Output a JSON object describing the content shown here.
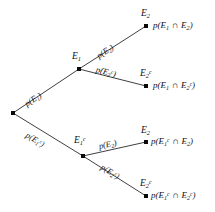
{
  "diagram": {
    "type": "probability-tree",
    "background_color": "#ffffff",
    "line_color": "#2a2a2a",
    "text_color": "#111111",
    "root": {
      "name": "root-node",
      "x": 13,
      "y": 113
    },
    "stage1_nodes": [
      {
        "id": "E1",
        "label_html": "E<span class=\"sub\">1</span>",
        "label_text": "E1",
        "x": 79,
        "y": 69,
        "branch_probability_html": "p(E<span class=\"sub\">1</span>)",
        "branch_probability_text": "p(E1)"
      },
      {
        "id": "E1c",
        "label_html": "E<span class=\"sub\">1</span><span class=\"sup\">c</span>",
        "label_text": "E1^c",
        "x": 83,
        "y": 156,
        "branch_probability_html": "p(E<span class=\"sub\">1</span><span class=\"sup\">c</span>)",
        "branch_probability_text": "p(E1^c)"
      }
    ],
    "leaves": [
      {
        "id": "leaf-E1-E2",
        "node_label_html": "E<span class=\"sub\">2</span>",
        "node_label_text": "E2",
        "x": 146,
        "y": 26,
        "branch_probability_html": "p(E<span class=\"sub\">2</span>)",
        "branch_probability_text": "p(E2)",
        "outcome_html": "p(E<span class=\"sub\">1</span> <span class=\"cap\">&#8745;</span> E<span class=\"sub\">2</span>)",
        "outcome_text": "p(E1 ∩ E2)"
      },
      {
        "id": "leaf-E1-E2c",
        "node_label_html": "E<span class=\"sub\">2</span><span class=\"sup\">c</span>",
        "node_label_text": "E2^c",
        "x": 146,
        "y": 86,
        "branch_probability_html": "p(E<span class=\"sub\">2</span><span class=\"sup\">c</span>)",
        "branch_probability_text": "p(E2^c)",
        "outcome_html": "p(E<span class=\"sub\">1</span> <span class=\"cap\">&#8745;</span> E<span class=\"sub\">2</span><span class=\"sup\">c</span>)",
        "outcome_text": "p(E1 ∩ E2^c)"
      },
      {
        "id": "leaf-E1c-E2",
        "node_label_html": "E<span class=\"sub\">2</span>",
        "node_label_text": "E2",
        "x": 146,
        "y": 142,
        "branch_probability_html": "p(E<span class=\"sub\">2</span>)",
        "branch_probability_text": "p(E2)",
        "outcome_html": "p(E<span class=\"sub\">1</span><span class=\"sup\">c</span> <span class=\"cap\">&#8745;</span> E<span class=\"sub\">2</span>)",
        "outcome_text": "p(E1^c ∩ E2)"
      },
      {
        "id": "leaf-E1c-E2c",
        "node_label_html": "E<span class=\"sub\">2</span><span class=\"sup\">c</span>",
        "node_label_text": "E2^c",
        "x": 146,
        "y": 196,
        "branch_probability_html": "p(E<span class=\"sub\">2</span><span class=\"sup\">c</span>)",
        "branch_probability_text": "p(E2^c)",
        "outcome_html": "p(E<span class=\"sub\">1</span><span class=\"sup\">c</span> <span class=\"cap\">&#8745;</span> E<span class=\"sub\">2</span><span class=\"sup\">c</span>)",
        "outcome_text": "p(E1^c ∩ E2^c)"
      }
    ]
  }
}
